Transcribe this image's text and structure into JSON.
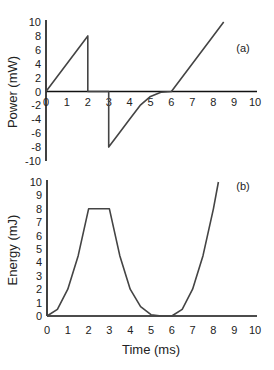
{
  "chart_data": [
    {
      "type": "line",
      "panel_label": "(a)",
      "title": "",
      "xlabel": "",
      "ylabel": "Power (mW)",
      "xlim": [
        0,
        10
      ],
      "ylim": [
        -10,
        10
      ],
      "x_ticks": [
        "0",
        "1",
        "2",
        "3",
        "4",
        "5",
        "6",
        "7",
        "8",
        "9",
        "10"
      ],
      "y_ticks": [
        "10",
        "8",
        "6",
        "4",
        "2",
        "0",
        "-2",
        "-4",
        "-6",
        "-8",
        "-10"
      ],
      "grid": false,
      "legend": null,
      "series": [
        {
          "name": "Power",
          "x": [
            0,
            2,
            2,
            3,
            3,
            3.5,
            4,
            4.5,
            5,
            5.5,
            6,
            7,
            8,
            8.5
          ],
          "y": [
            0,
            8,
            0,
            0,
            -8,
            -6,
            -4,
            -2,
            -0.7,
            -0.1,
            0,
            4,
            8,
            10
          ]
        }
      ]
    },
    {
      "type": "line",
      "panel_label": "(b)",
      "title": "",
      "xlabel": "Time (ms)",
      "ylabel": "Energy (mJ)",
      "xlim": [
        0,
        10
      ],
      "ylim": [
        0,
        10
      ],
      "x_ticks": [
        "0",
        "1",
        "2",
        "3",
        "4",
        "5",
        "6",
        "7",
        "8",
        "9",
        "10"
      ],
      "y_ticks": [
        "10",
        "9",
        "8",
        "7",
        "6",
        "5",
        "4",
        "3",
        "2",
        "1",
        "0"
      ],
      "grid": false,
      "legend": null,
      "series": [
        {
          "name": "Energy",
          "x": [
            0,
            0.5,
            1,
            1.5,
            2,
            3,
            3.5,
            4,
            4.5,
            5,
            5.5,
            6,
            6.5,
            7,
            7.5,
            8,
            8.24
          ],
          "y": [
            0,
            0.5,
            2,
            4.5,
            8,
            8,
            4.5,
            2,
            0.7,
            0.1,
            0,
            0,
            0.5,
            2,
            4.5,
            8,
            10
          ]
        }
      ]
    }
  ]
}
